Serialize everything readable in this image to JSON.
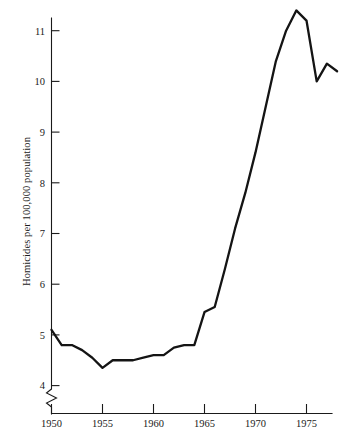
{
  "chart_data": {
    "type": "line",
    "title": "",
    "subtitle": "",
    "xlabel": "",
    "ylabel": "Homicides per 100,000 population",
    "xlim": [
      1949,
      1978.6
    ],
    "ylim": [
      3.75,
      11.6
    ],
    "grid": false,
    "legend": null,
    "y_axis_break": true,
    "y_axis_break_note": "axis broken below 4",
    "xticks": [
      1950,
      1955,
      1960,
      1965,
      1970,
      1975
    ],
    "xtick_labels": [
      "1950",
      "1955",
      "1960",
      "1965",
      "1970",
      "1975"
    ],
    "yticks": [
      4,
      5,
      6,
      7,
      8,
      9,
      10,
      11
    ],
    "ytick_labels": [
      "4",
      "5",
      "6",
      "7",
      "8",
      "9",
      "10",
      "11"
    ],
    "line_color": "#141414",
    "x": [
      1950,
      1951,
      1952,
      1953,
      1954,
      1955,
      1956,
      1957,
      1958,
      1959,
      1960,
      1961,
      1962,
      1963,
      1964,
      1965,
      1966,
      1967,
      1968,
      1969,
      1970,
      1971,
      1972,
      1973,
      1974,
      1975,
      1976,
      1977,
      1978
    ],
    "values": [
      5.1,
      4.8,
      4.8,
      4.7,
      4.55,
      4.35,
      4.5,
      4.5,
      4.5,
      4.55,
      4.6,
      4.6,
      4.75,
      4.8,
      4.8,
      5.45,
      5.55,
      6.3,
      7.1,
      7.8,
      8.6,
      9.5,
      10.4,
      11.0,
      11.4,
      11.2,
      10.0,
      10.35,
      10.2
    ]
  },
  "axis": {
    "ylabel": "Homicides per 100,000 population"
  }
}
